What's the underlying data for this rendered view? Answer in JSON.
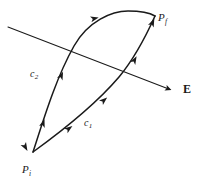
{
  "figure": {
    "type": "physics-diagram",
    "background_color": "#ffffff",
    "stroke_color": "#1a1a1a",
    "labels": {
      "initial_point": {
        "symbol": "P",
        "subscript": "i",
        "x": 22,
        "y": 160
      },
      "final_point": {
        "symbol": "P",
        "subscript": "f",
        "x": 158,
        "y": 8
      },
      "path_one": {
        "symbol": "c",
        "subscript": "1",
        "x": 84,
        "y": 113
      },
      "path_two": {
        "symbol": "c",
        "subscript": "2",
        "x": 30,
        "y": 64
      },
      "field": {
        "symbol": "E",
        "x": 183,
        "y": 83
      }
    },
    "geometry": {
      "point_initial": [
        33,
        152
      ],
      "point_final": [
        155,
        16
      ],
      "field_line_start": [
        8,
        27
      ],
      "field_line_end": [
        176,
        92
      ],
      "path_c1_arrowheads": 3,
      "path_c2_arrowheads": 3
    }
  }
}
